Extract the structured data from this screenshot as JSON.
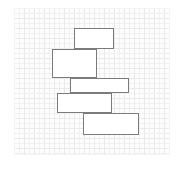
{
  "canvas": {
    "width": 185,
    "height": 169,
    "background": "#ffffff"
  },
  "panel": {
    "name": "grid-canvas",
    "x": 14,
    "y": 8,
    "width": 156,
    "height": 147,
    "background": "#fdfdfd",
    "grid": {
      "visible": true,
      "minor_spacing": 5,
      "major_spacing": 10,
      "minor_color": "#f1f1f1",
      "major_color": "#eaeaea"
    }
  },
  "diagram": {
    "type": "stacked-rectangles",
    "shape_count": 5,
    "stroke_color": "#7b7b7b",
    "fill_color": "#ffffff",
    "stroke_width": 1,
    "shapes": [
      {
        "id": "rect-1",
        "label": "rectangle-1",
        "x": 60,
        "y": 20,
        "width": 40,
        "height": 21
      },
      {
        "id": "rect-2",
        "label": "rectangle-2",
        "x": 38,
        "y": 41,
        "width": 45,
        "height": 29
      },
      {
        "id": "rect-3",
        "label": "rectangle-3",
        "x": 56,
        "y": 70,
        "width": 59,
        "height": 15
      },
      {
        "id": "rect-4",
        "label": "rectangle-4",
        "x": 43,
        "y": 85,
        "width": 55,
        "height": 20
      },
      {
        "id": "rect-5",
        "label": "rectangle-5",
        "x": 69,
        "y": 105,
        "width": 56,
        "height": 22
      }
    ]
  }
}
